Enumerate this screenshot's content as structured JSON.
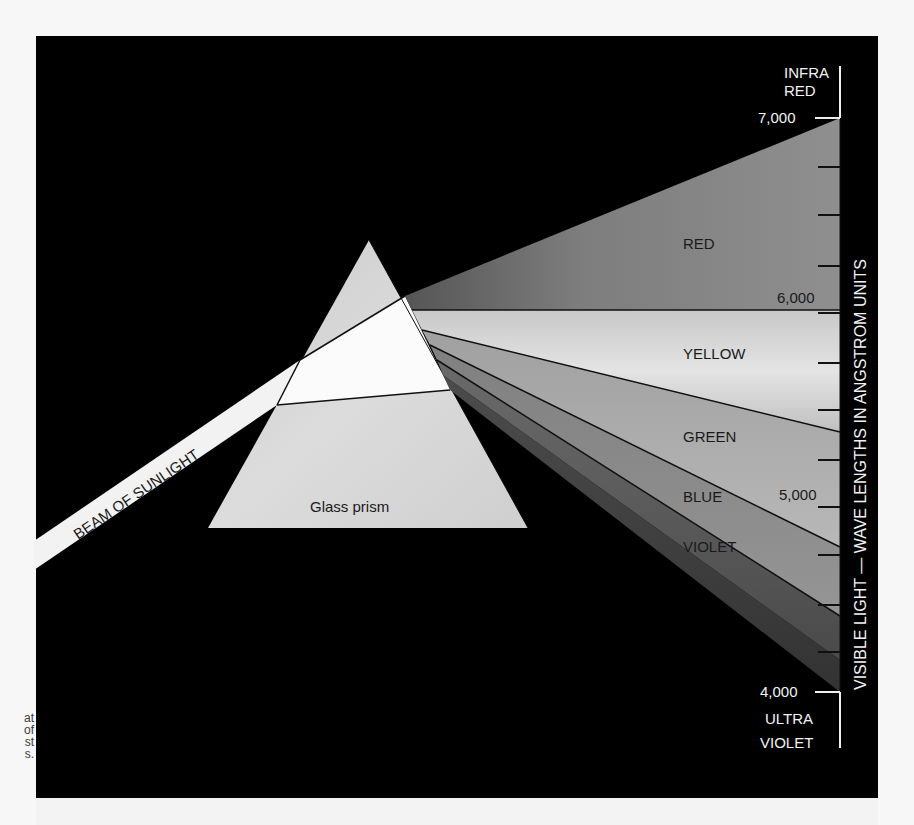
{
  "caption_fragment": [
    "at",
    "of",
    "st",
    "s."
  ],
  "diagram": {
    "title_axis": "VISIBLE LIGHT — WAVE LENGTHS IN ANGSTROM UNITS",
    "beam_label": "BEAM OF SUNLIGHT",
    "prism_label": "Glass prism",
    "top_label": [
      "INFRA",
      "RED"
    ],
    "bottom_label": [
      "ULTRA",
      "VIOLET"
    ],
    "scale": {
      "ticks": [
        {
          "value": "7,000",
          "label": "7,000"
        },
        {
          "value": "6,000",
          "label": "6,000"
        },
        {
          "value": "5,000",
          "label": "5,000"
        },
        {
          "value": "4,000",
          "label": "4,000"
        }
      ]
    },
    "bands": [
      {
        "name": "RED",
        "color": "#8a8a8a"
      },
      {
        "name": "YELLOW",
        "color": "#d6d6d6"
      },
      {
        "name": "GREEN",
        "color": "#a6a6a6"
      },
      {
        "name": "BLUE",
        "color": "#8c8c8c"
      },
      {
        "name": "VIOLET",
        "color": "#5e5e5e"
      }
    ]
  }
}
